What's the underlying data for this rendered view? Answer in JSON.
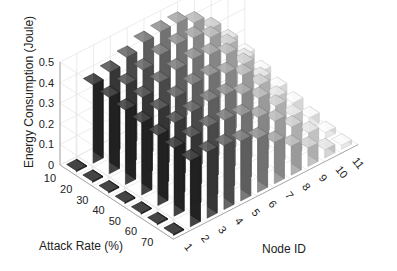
{
  "chart_data": {
    "type": "bar3d",
    "title": "",
    "xlabel": "Node ID",
    "ylabel": "Attack Rate (%)",
    "zlabel": "Energy Consumption (Joule)",
    "x_ticks": [
      "1",
      "2",
      "3",
      "4",
      "5",
      "6",
      "7",
      "8",
      "9",
      "10",
      "11"
    ],
    "y_ticks": [
      "10",
      "20",
      "30",
      "40",
      "50",
      "60",
      "70"
    ],
    "z_ticks": [
      "0",
      "0.1",
      "0.2",
      "0.3",
      "0.4",
      "0.5"
    ],
    "zlim": [
      0,
      0.5
    ],
    "grid": true,
    "colormap": "gray (dark for low node ID, light for high node ID)",
    "series": [
      {
        "name": "10",
        "values": [
          0.005,
          0.38,
          0.4,
          0.43,
          0.46,
          0.47,
          0.47,
          0.43,
          0.36,
          0.26,
          0.15
        ]
      },
      {
        "name": "20",
        "values": [
          0.005,
          0.37,
          0.39,
          0.42,
          0.45,
          0.46,
          0.45,
          0.41,
          0.33,
          0.22,
          0.12
        ]
      },
      {
        "name": "30",
        "values": [
          0.005,
          0.36,
          0.38,
          0.41,
          0.43,
          0.44,
          0.42,
          0.38,
          0.29,
          0.18,
          0.09
        ]
      },
      {
        "name": "40",
        "values": [
          0.005,
          0.35,
          0.37,
          0.39,
          0.41,
          0.41,
          0.38,
          0.33,
          0.24,
          0.14,
          0.07
        ]
      },
      {
        "name": "50",
        "values": [
          0.005,
          0.34,
          0.36,
          0.37,
          0.38,
          0.37,
          0.33,
          0.27,
          0.19,
          0.1,
          0.05
        ]
      },
      {
        "name": "60",
        "values": [
          0.005,
          0.33,
          0.34,
          0.35,
          0.34,
          0.32,
          0.27,
          0.21,
          0.14,
          0.07,
          0.03
        ]
      },
      {
        "name": "70",
        "values": [
          0.005,
          0.32,
          0.32,
          0.31,
          0.29,
          0.26,
          0.2,
          0.14,
          0.09,
          0.04,
          0.02
        ]
      }
    ]
  }
}
